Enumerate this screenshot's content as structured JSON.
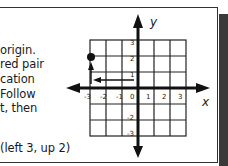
{
  "text_lines": [
    "origin.",
    "red pair",
    "cation",
    "Follow",
    "t, then"
  ],
  "example": "(left 3, up 2)",
  "graph": {
    "x_label": "x",
    "y_label": "y",
    "x_ticks": [
      "-3",
      "-2",
      "-1",
      "0",
      "1",
      "2",
      "3"
    ],
    "y_ticks_pos": [
      "3",
      "2",
      "1"
    ],
    "y_ticks_neg": [
      "-2",
      "-3"
    ],
    "point": {
      "x": -3,
      "y": 2
    },
    "path": [
      "left 3",
      "up 2"
    ]
  },
  "colors": {
    "ink": "#1a1a1a",
    "shadow": "#3a3a3a",
    "background": "#ffffff"
  }
}
